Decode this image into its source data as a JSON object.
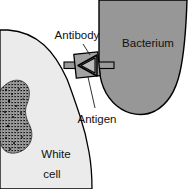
{
  "figure": {
    "background_color": "#ffffff",
    "width": 196,
    "height": 189
  },
  "labels": {
    "bacterium": "Bacterium",
    "antibody": "Antibody",
    "antigen": "Antigen",
    "white_cell_line1": "White",
    "white_cell_line2": "cell"
  },
  "colors": {
    "bacterium_fill": "#979797",
    "white_cell_fill": "#ebebeb",
    "nucleus_fill": "#2b2b2b",
    "antibody_fill": "#9a9a9a",
    "antibody_shadow": "#6e6e6e",
    "outline": "#000000",
    "text": "#111111",
    "background": "#ffffff"
  },
  "structures": [
    {
      "name": "bacterium",
      "description": "Large gray rounded bullet shape entering from the top right edge",
      "fill": "#979797"
    },
    {
      "name": "white-cell",
      "description": "Pale gray cell body occupying the left side with a dark stippled nucleus",
      "fill": "#ebebeb"
    },
    {
      "name": "white-cell-nucleus",
      "description": "Dark stippled irregular nucleus inside the white cell",
      "fill": "#2b2b2b"
    },
    {
      "name": "antibody-antigen-complex",
      "description": "Gray square antibody with a triangular antigen wedge, bridging the white cell membrane and the bacterium",
      "fill": "#9a9a9a"
    }
  ]
}
